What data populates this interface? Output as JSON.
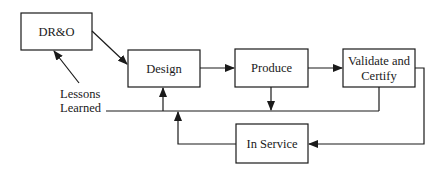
{
  "diagram": {
    "type": "process-flow",
    "colors": {
      "line": "#1a1a1a",
      "background": "#ffffff"
    },
    "nodes": [
      {
        "id": "dro",
        "label": "DR&O"
      },
      {
        "id": "design",
        "label": "Design"
      },
      {
        "id": "produce",
        "label": "Produce"
      },
      {
        "id": "validate",
        "label_line1": "Validate and",
        "label_line2": "Certify"
      },
      {
        "id": "inservice",
        "label": "In Service"
      }
    ],
    "annotations": {
      "lessons_line1": "Lessons",
      "lessons_line2": "Learned"
    },
    "edges": [
      {
        "from": "dro",
        "to": "design"
      },
      {
        "from": "design",
        "to": "produce"
      },
      {
        "from": "produce",
        "to": "validate"
      },
      {
        "from": "validate",
        "to": "inservice"
      },
      {
        "from": "produce",
        "to": "lessons-learned-line"
      },
      {
        "from": "validate",
        "to": "lessons-learned-line"
      },
      {
        "from": "inservice",
        "to": "lessons-learned-line"
      },
      {
        "from": "lessons-learned-line",
        "to": "design"
      },
      {
        "from": "lessons-learned",
        "to": "dro"
      }
    ]
  }
}
